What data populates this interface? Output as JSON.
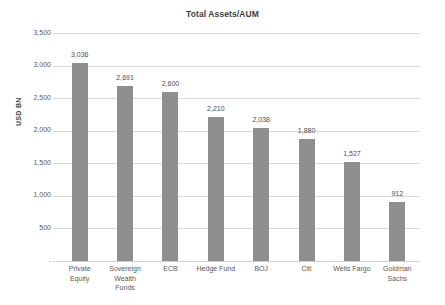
{
  "chart_data": {
    "type": "bar",
    "title": "Total Assets/AUM",
    "xlabel": "",
    "ylabel": "USD BN",
    "categories": [
      "Private Equity",
      "Sovereign Wealth Funds",
      "ECB",
      "Hedge Fund",
      "BOJ",
      "Citi",
      "Wells Fargo",
      "Goldman Sachs"
    ],
    "category_lines": [
      [
        "Private",
        "Equity"
      ],
      [
        "Sovereign",
        "Wealth",
        "Funds"
      ],
      [
        "ECB"
      ],
      [
        "Hedge Fund"
      ],
      [
        "BOJ"
      ],
      [
        "Citi"
      ],
      [
        "Wells Fargo"
      ],
      [
        "Goldman",
        "Sachs"
      ]
    ],
    "values": [
      3036,
      2691,
      2600,
      2210,
      2038,
      1880,
      1527,
      912
    ],
    "value_labels": [
      "3,036",
      "2,691",
      "2,600",
      "2,210",
      "2,038",
      "1,880",
      "1,527",
      "912"
    ],
    "ylim": [
      0,
      3500
    ],
    "yticks": [
      0,
      500,
      1000,
      1500,
      2000,
      2500,
      3000,
      3500
    ],
    "ytick_labels": [
      "-",
      "500",
      "1,000",
      "1,500",
      "2,000",
      "2,500",
      "3,000",
      "3,500"
    ],
    "grid": true,
    "legend": false,
    "bar_color": "#8f8f8f",
    "gridline_color": "#d9d9d9",
    "text_color": "#595959",
    "background": "#ffffff"
  }
}
